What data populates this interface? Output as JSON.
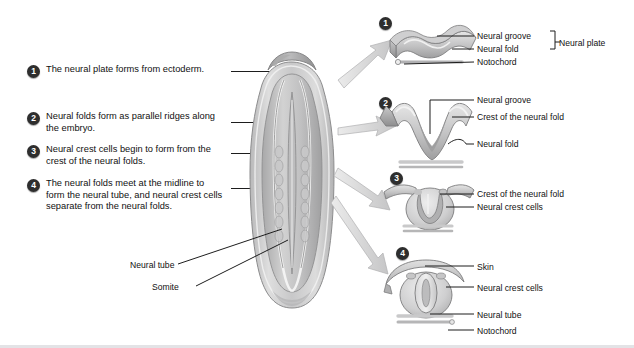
{
  "figure": {
    "background": "#ffffff",
    "badge_color": "#2e2e2e"
  },
  "steps": [
    {
      "num": "1",
      "text": "The neural plate forms from ectoderm."
    },
    {
      "num": "2",
      "text": "Neural folds form as parallel ridges along the embryo."
    },
    {
      "num": "3",
      "text": "Neural crest cells begin to form from the crest of the neural folds."
    },
    {
      "num": "4",
      "text": "The neural folds meet at the midline to form the neural tube, and neural crest cells separate from the neural folds."
    }
  ],
  "embryo": {
    "labels": [
      {
        "text": "Neural tube"
      },
      {
        "text": "Somite"
      }
    ]
  },
  "panels": [
    {
      "num": "1",
      "labels": [
        "Neural groove",
        "Neural fold",
        "Notochord"
      ],
      "bracket_label": "Neural plate"
    },
    {
      "num": "2",
      "labels": [
        "Neural groove",
        "Crest of the neural fold",
        "Neural fold"
      ]
    },
    {
      "num": "3",
      "labels": [
        "Crest of the neural fold",
        "Neural crest cells"
      ]
    },
    {
      "num": "4",
      "labels": [
        "Skin",
        "Neural crest cells",
        "Neural tube",
        "Notochord"
      ]
    }
  ]
}
